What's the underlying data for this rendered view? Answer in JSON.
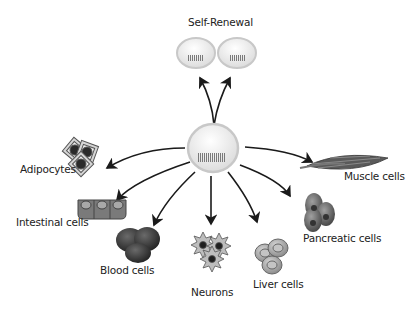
{
  "diagram": {
    "title": "Self-Renewal",
    "center": "stem-cell",
    "labels": {
      "self_renewal": "Self-Renewal",
      "adipocytes": "Adipocytes",
      "intestinal": "Intestinal cells",
      "blood": "Blood cells",
      "neurons": "Neurons",
      "liver": "Liver cells",
      "pancreatic": "Pancreatic cells",
      "muscle": "Muscle cells"
    },
    "colors": {
      "arrow": "#1a1a1a",
      "stem_cell_outline": "#c8c8c8",
      "stem_cell_fill": "#ececec",
      "dna_bar": "#8a8a8a",
      "cell_dark": "#3a3a3a",
      "cell_mid": "#6e6e6e",
      "cell_light": "#a5a5a5"
    }
  }
}
